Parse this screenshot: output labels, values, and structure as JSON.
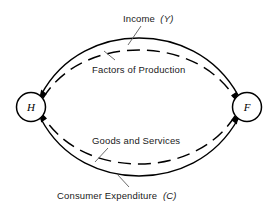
{
  "diagram": {
    "type": "circular-flow",
    "background_color": "#ffffff",
    "stroke_color": "#000000",
    "nodes": [
      {
        "id": "H",
        "letter": "H",
        "name": "households",
        "cx": 31,
        "cy": 107,
        "r": 14.5
      },
      {
        "id": "F",
        "letter": "F",
        "name": "firms",
        "cx": 247,
        "cy": 107,
        "r": 14.5
      }
    ],
    "flows": [
      {
        "id": "income",
        "label_main": "Income",
        "label_paren": "(Y)",
        "style": "solid",
        "from": "F",
        "to": "H",
        "direction": "right-to-left",
        "position": "outer-top"
      },
      {
        "id": "factors-of-production",
        "label_main": "Factors of Production",
        "label_paren": "",
        "style": "dashed",
        "from": "H",
        "to": "F",
        "direction": "left-to-right",
        "position": "inner-top"
      },
      {
        "id": "goods-and-services",
        "label_main": "Goods and Services",
        "label_paren": "",
        "style": "dashed",
        "from": "F",
        "to": "H",
        "direction": "right-to-left",
        "position": "inner-bottom"
      },
      {
        "id": "consumer-expenditure",
        "label_main": "Consumer  Expenditure",
        "label_paren": "(C)",
        "style": "solid",
        "from": "H",
        "to": "F",
        "direction": "left-to-right",
        "position": "outer-bottom"
      }
    ]
  }
}
